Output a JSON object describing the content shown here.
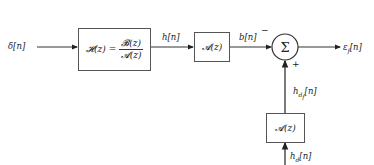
{
  "diagram": {
    "type": "block-diagram",
    "input": {
      "label": "δ[n]"
    },
    "blocks": {
      "H": {
        "lhs": "𝓗(z) =",
        "numerator": "𝓑(z)",
        "denominator": "𝓐(z)"
      },
      "A_top": {
        "label": "𝓐(z)"
      },
      "A_bottom": {
        "label": "𝓐(z)"
      }
    },
    "signals": {
      "h": "h[n]",
      "b": "b[n]",
      "hdf_base": "h",
      "hdf_sub": "d",
      "hdf_subsub": "f",
      "hdf_tail": "[n]",
      "hd_base": "h",
      "hd_sub": "d",
      "hd_tail": "[n]"
    },
    "summer": {
      "symbol": "Σ",
      "minus": "−",
      "plus": "+"
    },
    "output": {
      "base": "ε",
      "sub": "f",
      "tail": "[n]"
    },
    "colors": {
      "line": "#333333",
      "text": "#222222"
    }
  }
}
